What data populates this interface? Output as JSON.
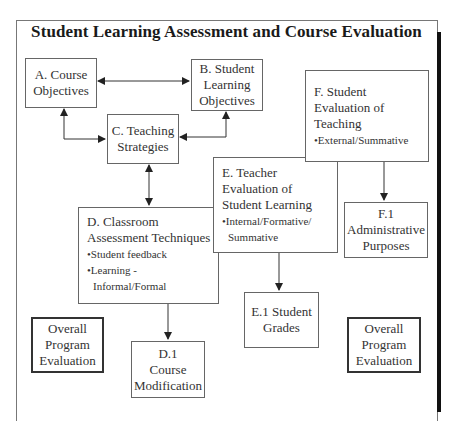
{
  "title": "Student Learning Assessment and Course Evaluation",
  "nodes": {
    "A": {
      "lines": [
        "A. Course",
        "Objectives"
      ]
    },
    "B": {
      "lines": [
        "B. Student",
        "Learning",
        "Objectives"
      ]
    },
    "C": {
      "lines": [
        "C. Teaching",
        "Strategies"
      ]
    },
    "D": {
      "lines": [
        "D. Classroom",
        "Assessment Techniques"
      ],
      "bullets": [
        "•Student feedback",
        "•Learning -",
        "Informal/Formal"
      ]
    },
    "D1": {
      "lines": [
        "D.1",
        "Course",
        "Modification"
      ]
    },
    "E": {
      "lines": [
        "E. Teacher",
        "Evaluation of",
        "Student Learning"
      ],
      "bullets": [
        "•Internal/Formative/",
        "Summative"
      ]
    },
    "E1": {
      "lines": [
        "E.1 Student",
        "Grades"
      ]
    },
    "F": {
      "lines": [
        "F. Student",
        "Evaluation of",
        "Teaching"
      ],
      "bullets": [
        "•External/Summative"
      ]
    },
    "F1": {
      "lines": [
        "F.1",
        "Administrative",
        "Purposes"
      ]
    },
    "OPE_left": {
      "lines": [
        "Overall",
        "Program",
        "Evaluation"
      ]
    },
    "OPE_right": {
      "lines": [
        "Overall",
        "Program",
        "Evaluation"
      ]
    }
  },
  "edges": [
    {
      "from": "A",
      "to": "B",
      "type": "bidirectional"
    },
    {
      "from": "A",
      "to": "C",
      "type": "bidirectional"
    },
    {
      "from": "B",
      "to": "C",
      "type": "bidirectional"
    },
    {
      "from": "C",
      "to": "D",
      "type": "bidirectional"
    },
    {
      "from": "D",
      "to": "D1",
      "type": "directed"
    },
    {
      "from": "E",
      "to": "E1",
      "type": "directed"
    },
    {
      "from": "F",
      "to": "F1",
      "type": "directed"
    }
  ],
  "colors": {
    "line": "#333333",
    "border": "#666666",
    "shadow": "#111111"
  }
}
